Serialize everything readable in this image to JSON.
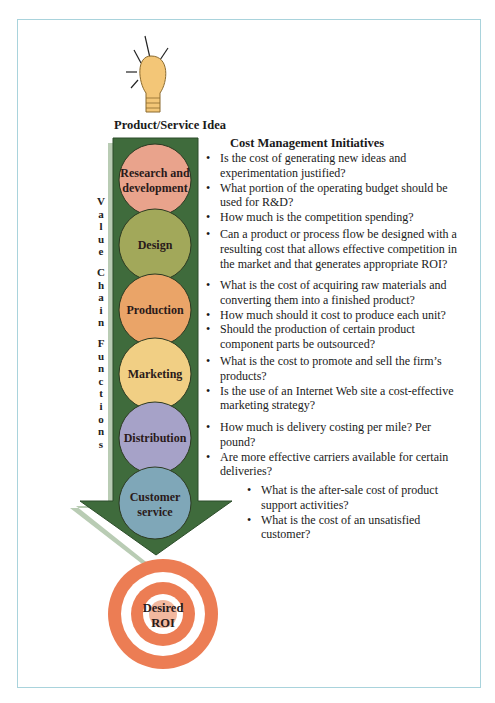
{
  "header": {
    "idea_label": "Product/Service Idea"
  },
  "side_label": {
    "words": [
      "Value",
      "Chain",
      "Functions"
    ]
  },
  "functions": [
    {
      "label_1": "Research and",
      "label_2": "development",
      "color": "#e9a38c"
    },
    {
      "label_1": "Design",
      "label_2": "",
      "color": "#a2a85a"
    },
    {
      "label_1": "Production",
      "label_2": "",
      "color": "#eaa468"
    },
    {
      "label_1": "Marketing",
      "label_2": "",
      "color": "#f1cf84"
    },
    {
      "label_1": "Distribution",
      "label_2": "",
      "color": "#a6a2c8"
    },
    {
      "label_1": "Customer",
      "label_2": "service",
      "color": "#7fa7b8"
    }
  ],
  "target": {
    "label_1": "Desired",
    "label_2": "ROI",
    "color": "#ec7d54"
  },
  "initiatives": {
    "title": "Cost Management Initiatives",
    "groups": [
      {
        "items": [
          "Is the cost of generating new ideas and experimentation justified?",
          "What portion of the operating budget should be used for R&D?",
          "How much is the competition spending?"
        ]
      },
      {
        "items": [
          "Can a product or process flow be designed with a resulting cost that allows effective competition in the market and that generates appropriate ROI?"
        ]
      },
      {
        "items": [
          "What is the cost of acquiring raw materials and converting them into a finished product?",
          "How much should it cost to produce each unit?",
          "Should the production of certain product component parts be outsourced?"
        ]
      },
      {
        "items": [
          "What is the cost to promote and sell the firm’s products?",
          "Is the use of an Internet Web site a cost-effective marketing strategy?"
        ]
      },
      {
        "items": [
          "How much is delivery costing per mile? Per pound?",
          "Are more effective carriers available for certain deliveries?"
        ]
      },
      {
        "items": [
          "What is the after-sale cost of product support activities?",
          "What is the cost of an unsatisfied customer?"
        ]
      }
    ]
  },
  "colors": {
    "arrow": "#3f6b3c",
    "arrow_shadow": "#b9ccb4",
    "bulb": "#f3c677",
    "frame": "#a9d3dc"
  }
}
